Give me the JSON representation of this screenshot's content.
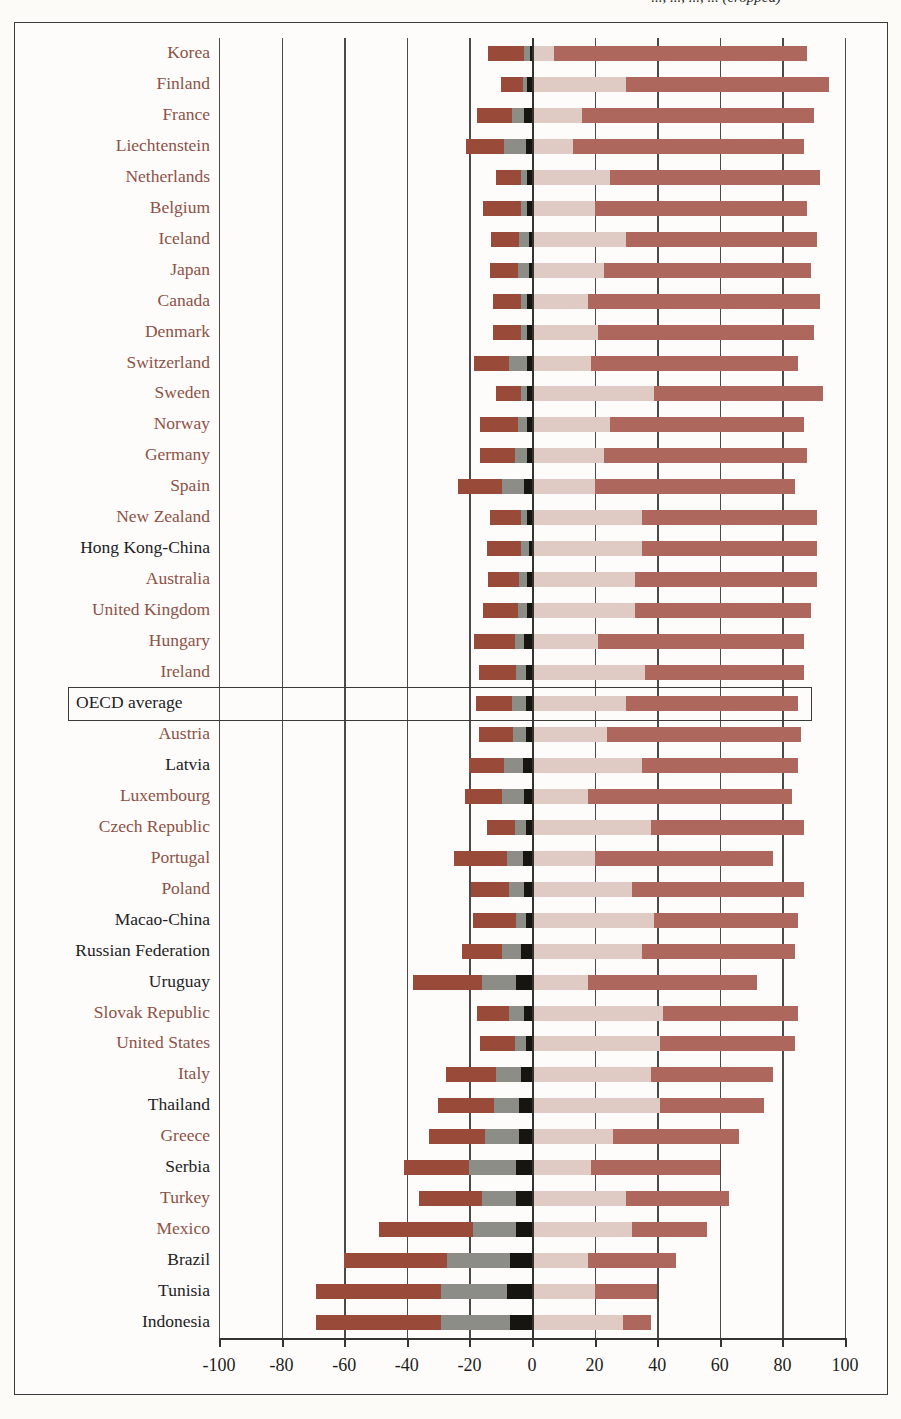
{
  "figure": {
    "title_fragment": "..., ..., ..., ... (cropped)",
    "axis": {
      "min": -100,
      "max": 100,
      "step": 20,
      "ticks": [
        "-100",
        "-80",
        "-60",
        "-40",
        "-20",
        "0",
        "20",
        "40",
        "60",
        "80",
        "100"
      ]
    },
    "highlight": {
      "label": "OECD average",
      "boxed": true
    },
    "colors": {
      "strongly_disagree": "#9a4a39",
      "disagree": "#8d8d88",
      "black_marker": "#17150f",
      "agree": "#e0cac4",
      "strongly_agree": "#ad675c",
      "oecd_member_label": "#8d5247",
      "non_oecd_label": "#23211f",
      "axis": "#35352f",
      "paper": "#fdfcfa"
    }
  },
  "chart_data": {
    "type": "bar",
    "subtype": "diverging-stacked-bar",
    "title": "",
    "xlabel": "",
    "ylabel": "",
    "xlim": [
      -100,
      100
    ],
    "grid": true,
    "legend_position": "none",
    "series": [
      {
        "name": "Strongly disagree",
        "color": "#9a4a39",
        "side": "negative"
      },
      {
        "name": "Disagree",
        "color": "#8d8d88",
        "side": "negative"
      },
      {
        "name": "Marker",
        "color": "#17150f",
        "side": "negative"
      },
      {
        "name": "Agree",
        "color": "#e0cac4",
        "side": "positive"
      },
      {
        "name": "Strongly agree",
        "color": "#ad675c",
        "side": "positive"
      }
    ],
    "categories": [
      "Korea",
      "Finland",
      "France",
      "Liechtenstein",
      "Netherlands",
      "Belgium",
      "Iceland",
      "Japan",
      "Canada",
      "Denmark",
      "Switzerland",
      "Sweden",
      "Norway",
      "Germany",
      "Spain",
      "New Zealand",
      "Hong Kong-China",
      "Australia",
      "United Kingdom",
      "Hungary",
      "Ireland",
      "OECD average",
      "Austria",
      "Latvia",
      "Luxembourg",
      "Czech Republic",
      "Portugal",
      "Poland",
      "Macao-China",
      "Russian Federation",
      "Uruguay",
      "Slovak Republic",
      "United States",
      "Italy",
      "Thailand",
      "Greece",
      "Serbia",
      "Turkey",
      "Mexico",
      "Brazil",
      "Tunisia",
      "Indonesia"
    ],
    "rows": [
      {
        "country": "Korea",
        "oecd": true,
        "strongly_disagree": -11.5,
        "disagree": -2.0,
        "marker": -0.5,
        "agree": 7.0,
        "strongly_agree": 81.0,
        "total_positive": 88.0,
        "total_negative": -14.0
      },
      {
        "country": "Finland",
        "oecd": true,
        "strongly_disagree": -7.0,
        "disagree": -1.5,
        "marker": -1.5,
        "agree": 30.0,
        "strongly_agree": 65.0,
        "total_positive": 95.0,
        "total_negative": -10.0
      },
      {
        "country": "France",
        "oecd": true,
        "strongly_disagree": -11.0,
        "disagree": -4.0,
        "marker": -2.5,
        "agree": 16.0,
        "strongly_agree": 74.0,
        "total_positive": 90.0,
        "total_negative": -17.5
      },
      {
        "country": "Liechtenstein",
        "oecd": true,
        "strongly_disagree": -12.0,
        "disagree": -7.0,
        "marker": -2.0,
        "agree": 13.0,
        "strongly_agree": 74.0,
        "total_positive": 87.0,
        "total_negative": -21.0
      },
      {
        "country": "Netherlands",
        "oecd": true,
        "strongly_disagree": -8.0,
        "disagree": -2.0,
        "marker": -1.5,
        "agree": 25.0,
        "strongly_agree": 67.0,
        "total_positive": 92.0,
        "total_negative": -11.5
      },
      {
        "country": "Belgium",
        "oecd": true,
        "strongly_disagree": -12.0,
        "disagree": -2.0,
        "marker": -1.5,
        "agree": 20.0,
        "strongly_agree": 68.0,
        "total_positive": 88.0,
        "total_negative": -15.5
      },
      {
        "country": "Iceland",
        "oecd": true,
        "strongly_disagree": -9.0,
        "disagree": -3.0,
        "marker": -1.0,
        "agree": 30.0,
        "strongly_agree": 61.0,
        "total_positive": 91.0,
        "total_negative": -13.0
      },
      {
        "country": "Japan",
        "oecd": true,
        "strongly_disagree": -9.0,
        "disagree": -3.5,
        "marker": -1.0,
        "agree": 23.0,
        "strongly_agree": 66.0,
        "total_positive": 89.0,
        "total_negative": -13.5
      },
      {
        "country": "Canada",
        "oecd": true,
        "strongly_disagree": -9.0,
        "disagree": -2.0,
        "marker": -1.5,
        "agree": 18.0,
        "strongly_agree": 74.0,
        "total_positive": 92.0,
        "total_negative": -12.5
      },
      {
        "country": "Denmark",
        "oecd": true,
        "strongly_disagree": -9.0,
        "disagree": -2.0,
        "marker": -1.5,
        "agree": 21.0,
        "strongly_agree": 69.0,
        "total_positive": 90.0,
        "total_negative": -12.5
      },
      {
        "country": "Switzerland",
        "oecd": true,
        "strongly_disagree": -11.0,
        "disagree": -6.0,
        "marker": -1.5,
        "agree": 19.0,
        "strongly_agree": 66.0,
        "total_positive": 85.0,
        "total_negative": -18.5
      },
      {
        "country": "Sweden",
        "oecd": true,
        "strongly_disagree": -8.0,
        "disagree": -2.0,
        "marker": -1.5,
        "agree": 39.0,
        "strongly_agree": 54.0,
        "total_positive": 93.0,
        "total_negative": -11.5
      },
      {
        "country": "Norway",
        "oecd": true,
        "strongly_disagree": -12.0,
        "disagree": -3.0,
        "marker": -1.5,
        "agree": 25.0,
        "strongly_agree": 62.0,
        "total_positive": 87.0,
        "total_negative": -16.5
      },
      {
        "country": "Germany",
        "oecd": true,
        "strongly_disagree": -11.0,
        "disagree": -4.0,
        "marker": -1.5,
        "agree": 23.0,
        "strongly_agree": 65.0,
        "total_positive": 88.0,
        "total_negative": -16.5
      },
      {
        "country": "Spain",
        "oecd": true,
        "strongly_disagree": -14.0,
        "disagree": -7.0,
        "marker": -2.5,
        "agree": 20.0,
        "strongly_agree": 64.0,
        "total_positive": 84.0,
        "total_negative": -23.5
      },
      {
        "country": "New Zealand",
        "oecd": true,
        "strongly_disagree": -10.0,
        "disagree": -2.0,
        "marker": -1.5,
        "agree": 35.0,
        "strongly_agree": 56.0,
        "total_positive": 91.0,
        "total_negative": -13.5
      },
      {
        "country": "Hong Kong-China",
        "oecd": false,
        "strongly_disagree": -11.0,
        "disagree": -2.5,
        "marker": -1.0,
        "agree": 35.0,
        "strongly_agree": 56.0,
        "total_positive": 91.0,
        "total_negative": -14.5
      },
      {
        "country": "Australia",
        "oecd": true,
        "strongly_disagree": -10.0,
        "disagree": -2.5,
        "marker": -1.5,
        "agree": 33.0,
        "strongly_agree": 58.0,
        "total_positive": 91.0,
        "total_negative": -14.0
      },
      {
        "country": "United Kingdom",
        "oecd": true,
        "strongly_disagree": -11.0,
        "disagree": -3.0,
        "marker": -1.5,
        "agree": 33.0,
        "strongly_agree": 56.0,
        "total_positive": 89.0,
        "total_negative": -15.5
      },
      {
        "country": "Hungary",
        "oecd": true,
        "strongly_disagree": -13.0,
        "disagree": -3.0,
        "marker": -2.5,
        "agree": 21.0,
        "strongly_agree": 66.0,
        "total_positive": 87.0,
        "total_negative": -18.5
      },
      {
        "country": "Ireland",
        "oecd": true,
        "strongly_disagree": -12.0,
        "disagree": -3.0,
        "marker": -2.0,
        "agree": 36.0,
        "strongly_agree": 51.0,
        "total_positive": 87.0,
        "total_negative": -17.0
      },
      {
        "country": "OECD average",
        "oecd": true,
        "strongly_disagree": -11.5,
        "disagree": -4.5,
        "marker": -2.0,
        "agree": 30.0,
        "strongly_agree": 55.0,
        "total_positive": 85.0,
        "total_negative": -18.0
      },
      {
        "country": "Austria",
        "oecd": true,
        "strongly_disagree": -11.0,
        "disagree": -4.0,
        "marker": -2.0,
        "agree": 24.0,
        "strongly_agree": 62.0,
        "total_positive": 86.0,
        "total_negative": -17.0
      },
      {
        "country": "Latvia",
        "oecd": false,
        "strongly_disagree": -11.0,
        "disagree": -6.0,
        "marker": -3.0,
        "agree": 35.0,
        "strongly_agree": 50.0,
        "total_positive": 85.0,
        "total_negative": -20.0
      },
      {
        "country": "Luxembourg",
        "oecd": true,
        "strongly_disagree": -12.0,
        "disagree": -7.0,
        "marker": -2.5,
        "agree": 18.0,
        "strongly_agree": 65.0,
        "total_positive": 83.0,
        "total_negative": -21.5
      },
      {
        "country": "Czech Republic",
        "oecd": true,
        "strongly_disagree": -9.0,
        "disagree": -3.5,
        "marker": -2.0,
        "agree": 38.0,
        "strongly_agree": 49.0,
        "total_positive": 87.0,
        "total_negative": -14.5
      },
      {
        "country": "Portugal",
        "oecd": true,
        "strongly_disagree": -17.0,
        "disagree": -5.0,
        "marker": -3.0,
        "agree": 20.0,
        "strongly_agree": 57.0,
        "total_positive": 77.0,
        "total_negative": -25.0
      },
      {
        "country": "Poland",
        "oecd": true,
        "strongly_disagree": -12.0,
        "disagree": -5.0,
        "marker": -2.5,
        "agree": 32.0,
        "strongly_agree": 55.0,
        "total_positive": 87.0,
        "total_negative": -19.5
      },
      {
        "country": "Macao-China",
        "oecd": false,
        "strongly_disagree": -14.0,
        "disagree": -3.0,
        "marker": -2.0,
        "agree": 39.0,
        "strongly_agree": 46.0,
        "total_positive": 85.0,
        "total_negative": -19.0
      },
      {
        "country": "Russian Federation",
        "oecd": false,
        "strongly_disagree": -13.0,
        "disagree": -6.0,
        "marker": -3.5,
        "agree": 35.0,
        "strongly_agree": 49.0,
        "total_positive": 84.0,
        "total_negative": -22.5
      },
      {
        "country": "Uruguay",
        "oecd": false,
        "strongly_disagree": -22.0,
        "disagree": -11.0,
        "marker": -5.0,
        "agree": 18.0,
        "strongly_agree": 54.0,
        "total_positive": 72.0,
        "total_negative": -38.0
      },
      {
        "country": "Slovak Republic",
        "oecd": true,
        "strongly_disagree": -10.0,
        "disagree": -5.0,
        "marker": -2.5,
        "agree": 42.0,
        "strongly_agree": 43.0,
        "total_positive": 85.0,
        "total_negative": -17.5
      },
      {
        "country": "United States",
        "oecd": true,
        "strongly_disagree": -11.0,
        "disagree": -3.5,
        "marker": -2.0,
        "agree": 41.0,
        "strongly_agree": 43.0,
        "total_positive": 84.0,
        "total_negative": -16.5
      },
      {
        "country": "Italy",
        "oecd": true,
        "strongly_disagree": -16.0,
        "disagree": -8.0,
        "marker": -3.5,
        "agree": 38.0,
        "strongly_agree": 39.0,
        "total_positive": 77.0,
        "total_negative": -27.5
      },
      {
        "country": "Thailand",
        "oecd": false,
        "strongly_disagree": -18.0,
        "disagree": -8.0,
        "marker": -4.0,
        "agree": 41.0,
        "strongly_agree": 33.0,
        "total_positive": 74.0,
        "total_negative": -30.0
      },
      {
        "country": "Greece",
        "oecd": true,
        "strongly_disagree": -18.0,
        "disagree": -11.0,
        "marker": -4.0,
        "agree": 26.0,
        "strongly_agree": 40.0,
        "total_positive": 66.0,
        "total_negative": -33.0
      },
      {
        "country": "Serbia",
        "oecd": false,
        "strongly_disagree": -21.0,
        "disagree": -15.0,
        "marker": -5.0,
        "agree": 19.0,
        "strongly_agree": 41.0,
        "total_positive": 60.0,
        "total_negative": -41.0
      },
      {
        "country": "Turkey",
        "oecd": true,
        "strongly_disagree": -20.0,
        "disagree": -11.0,
        "marker": -5.0,
        "agree": 30.0,
        "strongly_agree": 33.0,
        "total_positive": 63.0,
        "total_negative": -36.0
      },
      {
        "country": "Mexico",
        "oecd": true,
        "strongly_disagree": -30.0,
        "disagree": -14.0,
        "marker": -5.0,
        "agree": 32.0,
        "strongly_agree": 24.0,
        "total_positive": 56.0,
        "total_negative": -49.0
      },
      {
        "country": "Brazil",
        "oecd": false,
        "strongly_disagree": -33.0,
        "disagree": -20.0,
        "marker": -7.0,
        "agree": 18.0,
        "strongly_agree": 28.0,
        "total_positive": 46.0,
        "total_negative": -60.0
      },
      {
        "country": "Tunisia",
        "oecd": false,
        "strongly_disagree": -40.0,
        "disagree": -21.0,
        "marker": -8.0,
        "agree": 20.0,
        "strongly_agree": 20.0,
        "total_positive": 40.0,
        "total_negative": -69.0
      },
      {
        "country": "Indonesia",
        "oecd": false,
        "strongly_disagree": -40.0,
        "disagree": -22.0,
        "marker": -7.0,
        "agree": 29.0,
        "strongly_agree": 9.0,
        "total_positive": 38.0,
        "total_negative": -69.0
      }
    ]
  }
}
